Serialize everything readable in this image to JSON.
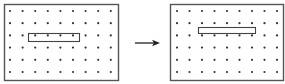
{
  "diagram": {
    "colors": {
      "frame": "#555555",
      "dot": "#333333",
      "bar": "#444444",
      "bar_fill_after": "#ffffff",
      "arrow": "#222222"
    },
    "grid": {
      "columns": 9,
      "rows": 6
    },
    "panels": [
      {
        "id": "before",
        "frame": {
          "x": 4,
          "y": 4,
          "w": 114,
          "h": 76
        },
        "dot_origin": {
          "x": 10,
          "y": 11
        },
        "dot_spacing": {
          "x": 12.6,
          "y": 12.2
        },
        "bar": {
          "x": 28,
          "y": 33,
          "w": 51,
          "h": 8,
          "aligned_to_row": 3,
          "span_columns": [
            3,
            6
          ]
        }
      },
      {
        "id": "after",
        "frame": {
          "x": 170,
          "y": 4,
          "w": 113,
          "h": 76
        },
        "dot_origin": {
          "x": 177,
          "y": 11
        },
        "dot_spacing": {
          "x": 12.5,
          "y": 12.2
        },
        "bar": {
          "x": 198,
          "y": 27,
          "w": 57,
          "h": 6,
          "position": "between rows 2 and 3"
        }
      }
    ],
    "arrow": {
      "x1": 135,
      "y1": 43,
      "x2": 160,
      "y2": 43,
      "direction": "right"
    }
  }
}
